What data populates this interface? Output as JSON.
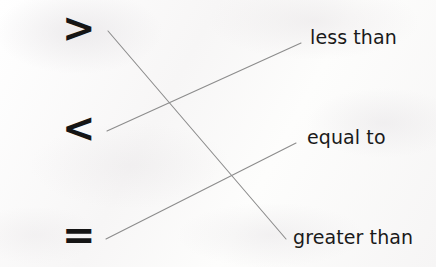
{
  "worksheet": {
    "type": "matching-exercise",
    "background_color": "#fbfbfa",
    "line_color": "#8c8c8c",
    "text_color": "#1a1a1a"
  },
  "symbols": [
    {
      "id": "greater-than-symbol",
      "glyph": ">",
      "x": 62,
      "y": 8,
      "anchor_x": 108,
      "anchor_y": 31
    },
    {
      "id": "less-than-symbol",
      "glyph": "<",
      "x": 62,
      "y": 108,
      "anchor_x": 107,
      "anchor_y": 131
    },
    {
      "id": "equals-symbol",
      "glyph": "=",
      "x": 62,
      "y": 215,
      "anchor_x": 106,
      "anchor_y": 239
    }
  ],
  "labels": [
    {
      "id": "label-less-than",
      "text": "less than",
      "x": 310,
      "y": 28,
      "anchor_x": 301,
      "anchor_y": 43
    },
    {
      "id": "label-equal-to",
      "text": "equal to",
      "x": 307,
      "y": 128,
      "anchor_x": 296,
      "anchor_y": 143
    },
    {
      "id": "label-greater-than",
      "text": "greater than",
      "x": 293,
      "y": 228,
      "anchor_x": 286,
      "anchor_y": 239
    }
  ],
  "connectors": [
    {
      "id": "connector-greater-than",
      "from": "greater-than-symbol",
      "to": "label-greater-than",
      "x1": 108,
      "y1": 31,
      "x2": 286,
      "y2": 239
    },
    {
      "id": "connector-less-than",
      "from": "less-than-symbol",
      "to": "label-less-than",
      "x1": 107,
      "y1": 131,
      "x2": 301,
      "y2": 43
    },
    {
      "id": "connector-equal-to",
      "from": "equals-symbol",
      "to": "label-equal-to",
      "x1": 106,
      "y1": 239,
      "x2": 296,
      "y2": 143
    }
  ]
}
